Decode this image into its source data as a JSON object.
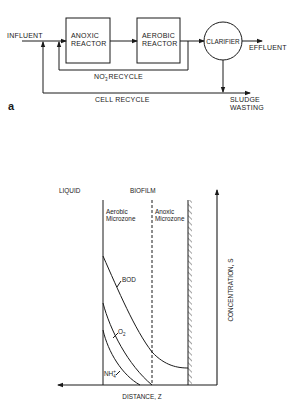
{
  "panel_a": {
    "label": "a",
    "influent": "INFLUENT",
    "anoxic_reactor": [
      "ANOXIC",
      "REACTOR"
    ],
    "aerobic_reactor": [
      "AEROBIC",
      "REACTOR"
    ],
    "clarifier": "CLARIFIER",
    "effluent": "EFFLUENT",
    "nitrate_recycle": {
      "prefix": "NO",
      "sub": "3",
      "sup": "-",
      "suffix": " RECYCLE"
    },
    "cell_recycle": "CELL RECYCLE",
    "sludge_wasting": [
      "SLUDGE",
      "WASTING"
    ]
  },
  "panel_b": {
    "liquid_label": "LIQUID",
    "biofilm_label": "BIOFILM",
    "aerobic_zone": [
      "Aerobic",
      "Microzone"
    ],
    "anoxic_zone": [
      "Anoxic",
      "Microzone"
    ],
    "x_axis_label": "DISTANCE, Z",
    "y_axis_label": "CONCENTRATION, S",
    "curves": [
      {
        "name": "BOD",
        "label": "BOD"
      },
      {
        "name": "O2",
        "label": "O",
        "sub": "2"
      },
      {
        "name": "NH4+",
        "label": "NH",
        "sub": "4",
        "sup": "+"
      }
    ]
  }
}
